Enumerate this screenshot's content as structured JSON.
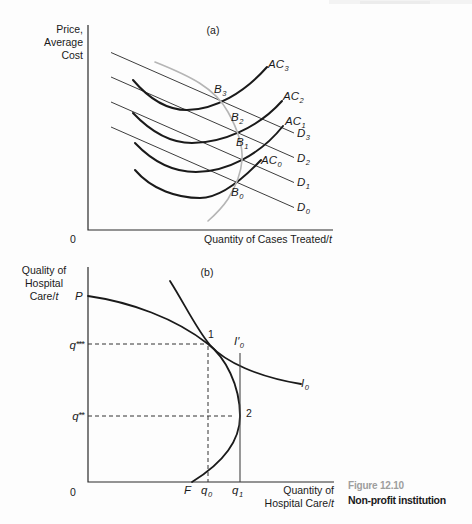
{
  "figure": {
    "caption": {
      "number": "Figure 12.10",
      "title": "Non-profit institution"
    }
  },
  "panel_a": {
    "tag": "(a)",
    "y_axis_lines": [
      "Price,",
      "Average",
      "Cost"
    ],
    "x_axis_label": {
      "text": "Quantity of Cases Treated/",
      "italic_suffix": "t"
    },
    "origin": "0",
    "labels": {
      "ac3": {
        "base": "AC",
        "sub": "3"
      },
      "ac2": {
        "base": "AC",
        "sub": "2"
      },
      "ac1": {
        "base": "AC",
        "sub": "1"
      },
      "ac0": {
        "base": "AC",
        "sub": "0"
      },
      "d3": {
        "base": "D",
        "sub": "3"
      },
      "d2": {
        "base": "D",
        "sub": "2"
      },
      "d1": {
        "base": "D",
        "sub": "1"
      },
      "d0": {
        "base": "D",
        "sub": "0"
      },
      "b3": {
        "base": "B",
        "sub": "3"
      },
      "b2": {
        "base": "B",
        "sub": "2"
      },
      "b1": {
        "base": "B",
        "sub": "1"
      },
      "b0": {
        "base": "B",
        "sub": "0"
      }
    }
  },
  "panel_b": {
    "tag": "(b)",
    "y_axis_lines": [
      "Quality of",
      "Hospital"
    ],
    "y_axis_line3": {
      "text": "Care/",
      "italic_suffix": "t"
    },
    "x_axis_line1": "Quantity of",
    "x_axis_line2": {
      "text": "Hospital Care/",
      "italic_suffix": "t"
    },
    "origin": "0",
    "labels": {
      "p": "P",
      "q_triple_star": {
        "base": "q",
        "sup": "***"
      },
      "q_double_star": {
        "base": "q",
        "sup": "**"
      },
      "pt1": "1",
      "pt2": "2",
      "i0prime": {
        "base": "I′",
        "sub": "0"
      },
      "i0": {
        "base": "I",
        "sub": "0"
      },
      "f": "F",
      "q0": {
        "base": "q",
        "sub": "0"
      },
      "q1": {
        "base": "q",
        "sub": "1"
      }
    }
  },
  "colors": {
    "ink": "#1a1a1a",
    "thin_line": "#3d3d3d",
    "locus_gray": "#b5b5b5",
    "caption_number_gray": "#9e9e9e"
  }
}
